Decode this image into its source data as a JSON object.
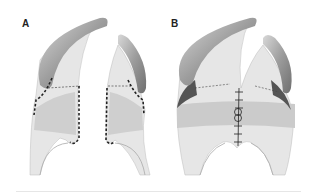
{
  "figure": {
    "panels": [
      {
        "label": "A",
        "description": "Cleft palate flaps with dashed incision lines"
      },
      {
        "label": "B",
        "description": "Closed muscle sling with midline sutures"
      }
    ],
    "colors": {
      "tissue": "#e4e4e4",
      "muscle": "#c9c9c9",
      "bone": "#a9a9a9",
      "incision": "#222222",
      "background": "#ffffff"
    }
  }
}
